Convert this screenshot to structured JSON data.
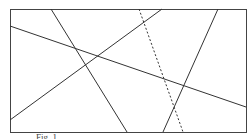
{
  "diagram": {
    "frame": {
      "x": 10,
      "y": 9,
      "width": 236,
      "height": 123,
      "stroke": "#444444"
    },
    "lines": [
      {
        "id": "line-a",
        "x1": 51,
        "y1": 9,
        "x2": 127,
        "y2": 132,
        "style": "solid"
      },
      {
        "id": "line-b",
        "x1": 10,
        "y1": 26,
        "x2": 246,
        "y2": 107,
        "style": "solid"
      },
      {
        "id": "line-c",
        "x1": 10,
        "y1": 120,
        "x2": 162,
        "y2": 9,
        "style": "solid"
      },
      {
        "id": "line-d",
        "x1": 218,
        "y1": 9,
        "x2": 163,
        "y2": 132,
        "style": "solid"
      },
      {
        "id": "line-e",
        "x1": 139,
        "y1": 9,
        "x2": 183,
        "y2": 132,
        "style": "dashed"
      }
    ],
    "line_color": "#333333"
  },
  "caption": {
    "text": "Fig. 1"
  }
}
